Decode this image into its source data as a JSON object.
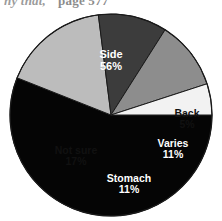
{
  "page": {
    "running_head": "ny that,",
    "page_number": "page 577"
  },
  "chart_data": {
    "type": "pie",
    "title": "",
    "subtitle": "",
    "xlabel": "",
    "ylabel": "",
    "legend_position": "none",
    "labels_inside_slices": true,
    "grid": false,
    "units": "percent",
    "categories": [
      "Side",
      "Back",
      "Varies",
      "Stomach",
      "Not sure"
    ],
    "values": [
      56,
      5,
      11,
      11,
      17
    ],
    "value_labels": [
      "56%",
      "5%",
      "11%",
      "11%",
      "17%"
    ],
    "start_angle_deg": 0,
    "direction": "clockwise",
    "slices": [
      {
        "name": "Side",
        "value": 56,
        "value_label": "56%",
        "color": "#050505",
        "label_color": "#ffffff",
        "start_deg": 0,
        "end_deg": 201.6
      },
      {
        "name": "Not sure",
        "value": 17,
        "value_label": "17%",
        "color": "#bcbcbc",
        "label_color": "#111111",
        "start_deg": 201.6,
        "end_deg": 262.8
      },
      {
        "name": "Stomach",
        "value": 11,
        "value_label": "11%",
        "color": "#3c3c3c",
        "label_color": "#ffffff",
        "start_deg": 262.8,
        "end_deg": 302.4
      },
      {
        "name": "Varies",
        "value": 11,
        "value_label": "11%",
        "color": "#8d8d8d",
        "label_color": "#ffffff",
        "start_deg": 302.4,
        "end_deg": 342.0
      },
      {
        "name": "Back",
        "value": 5,
        "value_label": "5%",
        "color": "#f2f2f2",
        "label_color": "#111111",
        "start_deg": 342.0,
        "end_deg": 360.0
      }
    ]
  },
  "labels": {
    "side": {
      "name": "Side",
      "value": "56%"
    },
    "back": {
      "name": "Back",
      "value": "5%"
    },
    "varies": {
      "name": "Varies",
      "value": "11%"
    },
    "stomach": {
      "name": "Stomach",
      "value": "11%"
    },
    "notsure": {
      "name": "Not sure",
      "value": "17%"
    }
  },
  "geometry": {
    "center_x": 111,
    "center_y": 115,
    "radius": 101
  },
  "colors": {
    "side": "#050505",
    "back": "#f2f2f2",
    "varies": "#8d8d8d",
    "stomach": "#3c3c3c",
    "not_sure": "#bcbcbc",
    "outline": "#1a1a1a",
    "background": "#ffffff"
  }
}
